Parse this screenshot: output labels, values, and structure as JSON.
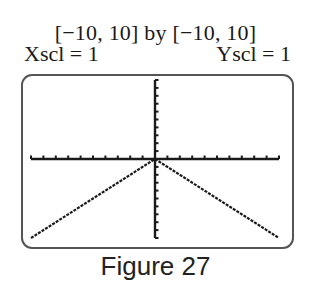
{
  "header": {
    "window_label": "[−10, 10] by [−10, 10]",
    "xscl_label": "Xscl = 1",
    "yscl_label": "Yscl = 1"
  },
  "caption": "Figure 27",
  "colors": {
    "axis": "#1a1a1a",
    "graph": "#1a1a1a",
    "frame": "#555555"
  },
  "chart_data": {
    "type": "line",
    "title": "[−10, 10] by [−10, 10]",
    "function": "y = -|x|",
    "xlabel": "",
    "ylabel": "",
    "xlim": [
      -10,
      10
    ],
    "ylim": [
      -10,
      10
    ],
    "xscl": 1,
    "yscl": 1,
    "grid": false,
    "x": [
      -10,
      -5,
      0,
      5,
      10
    ],
    "series": [
      {
        "name": "y = -|x|",
        "values": [
          -10,
          -5,
          0,
          -5,
          -10
        ]
      }
    ],
    "caption": "Figure 27"
  }
}
